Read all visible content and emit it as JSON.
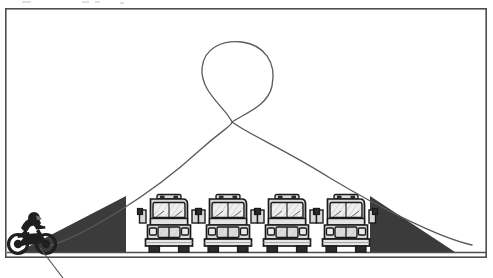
{
  "figure": {
    "kind": "line-art-illustration",
    "frame": {
      "x": 5,
      "y": 8,
      "width": 482,
      "height": 250,
      "stroke_color": "#4d4d4d",
      "fill_color": "#ffffff",
      "stroke_width": 1.6
    },
    "ground": {
      "label": "ground-line",
      "y": 252,
      "x_start": 7,
      "x_end": 486,
      "color": "#4d4d4d"
    },
    "colors": {
      "ramp_fill": "#3b3b3b",
      "line": "#5a5a5a",
      "outline": "#1a1a1a",
      "bus_body": "#d9d9d9",
      "bus_window": "#efefef",
      "bus_dark": "#2b2b2b",
      "background": "#ffffff"
    }
  },
  "ramps": [
    {
      "name": "launch-ramp",
      "side": "left",
      "base_x": 18,
      "apex_x": 126,
      "apex_y": 196,
      "base_y": 252,
      "fill": "#3b3b3b"
    },
    {
      "name": "landing-ramp",
      "side": "right",
      "base_x": 455,
      "apex_x": 370,
      "apex_y": 196,
      "base_y": 252,
      "fill": "#3b3b3b"
    }
  ],
  "buses": {
    "count": 4,
    "label": "school-bus",
    "view": "front",
    "width": 50,
    "height": 58,
    "ground_y": 252,
    "positions": [
      {
        "index": 1,
        "x": 144
      },
      {
        "index": 2,
        "x": 203
      },
      {
        "index": 3,
        "x": 262
      },
      {
        "index": 4,
        "x": 321
      }
    ]
  },
  "trajectory": {
    "name": "jump-trajectory",
    "description": "looping flight path from launch ramp up through a loop and down to the landing ramp",
    "stroke_color": "#5a5a5a",
    "stroke_width": 1.3,
    "crossing_point": {
      "x": 232,
      "y": 122
    },
    "loop_top_y": 42,
    "start": {
      "x": 48,
      "y": 246
    },
    "end": {
      "x": 472,
      "y": 245
    }
  },
  "rider": {
    "name": "motorcycle-rider",
    "x": 8,
    "y": 210,
    "width": 48,
    "height": 44,
    "facing": "right",
    "body_color": "#1f1f1f"
  },
  "leader_line": {
    "name": "callout-leader-line",
    "from": {
      "x": 40,
      "y": 248
    },
    "to": {
      "x": 63,
      "y": 278
    },
    "stroke_color": "#5a5a5a",
    "stroke_width": 1.2
  },
  "top_artifacts": [
    {
      "x": 22,
      "y": 1,
      "width": 9
    },
    {
      "x": 82,
      "y": 1,
      "width": 7
    },
    {
      "x": 95,
      "y": 1,
      "width": 5
    },
    {
      "x": 120,
      "y": 2,
      "width": 4
    }
  ]
}
